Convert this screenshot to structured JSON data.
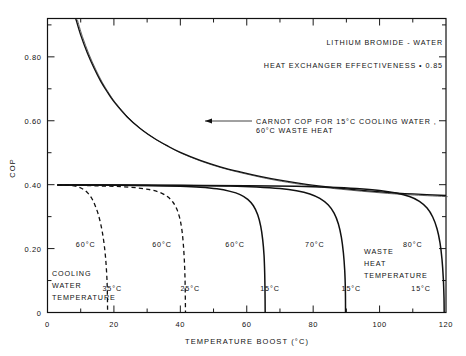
{
  "chart_data": {
    "type": "line",
    "title": "",
    "xlabel": "TEMPERATURE  BOOST  (°C)",
    "ylabel": "COP",
    "xlim": [
      0,
      120
    ],
    "ylim": [
      0,
      0.92
    ],
    "grid": false,
    "legend": "none",
    "x_major_ticks": [
      0,
      20,
      40,
      60,
      80,
      100,
      120
    ],
    "x_major_labels": [
      "0",
      "20",
      "40",
      "60",
      "80",
      "100",
      "120"
    ],
    "x_minor_ticks": [
      10,
      30,
      50,
      70,
      90,
      110
    ],
    "y_major_ticks": [
      0,
      0.2,
      0.4,
      0.6,
      0.8
    ],
    "y_major_labels": [
      "0",
      "0.20",
      "0.40",
      "0.60",
      "0.80"
    ],
    "y_minor_ticks": [
      0.1,
      0.3,
      0.5,
      0.7,
      0.9
    ],
    "annotations": {
      "header_1": "LITHIUM  BROMIDE - WATER",
      "header_2": "HEAT   EXCHANGER   EFFECTIVENESS  • 0.85",
      "carnot_line_1": "CARNOT  COP  FOR  15°C  COOLING  WATER ,",
      "carnot_line_2": "60°C WASTE HEAT",
      "cooling_water_l1": "COOLING",
      "cooling_water_l2": "WATER",
      "cooling_water_l3": "TEMPERATURE",
      "waste_heat_l1": "WASTE",
      "waste_heat_l2": "HEAT",
      "waste_heat_l3": "TEMPERATURE"
    },
    "series": [
      {
        "name": "carnot-cop",
        "style": "double-line",
        "waste_heat": "60°C",
        "cooling_water": "15°C",
        "points": [
          [
            8.5,
            0.92
          ],
          [
            10,
            0.868
          ],
          [
            12,
            0.812
          ],
          [
            14,
            0.765
          ],
          [
            16,
            0.724
          ],
          [
            18,
            0.69
          ],
          [
            20,
            0.66
          ],
          [
            24,
            0.612
          ],
          [
            28,
            0.575
          ],
          [
            32,
            0.546
          ],
          [
            36,
            0.522
          ],
          [
            40,
            0.501
          ],
          [
            46,
            0.476
          ],
          [
            52,
            0.456
          ],
          [
            58,
            0.44
          ],
          [
            64,
            0.426
          ],
          [
            70,
            0.414
          ],
          [
            78,
            0.401
          ],
          [
            86,
            0.391
          ],
          [
            94,
            0.383
          ],
          [
            102,
            0.376
          ],
          [
            110,
            0.371
          ],
          [
            120,
            0.366
          ]
        ]
      },
      {
        "name": "curve-60-35",
        "style": "dashed",
        "waste_heat": "60°C",
        "cooling_water": "35°C",
        "label_top": "60°C",
        "label_bottom": "35°C",
        "points": [
          [
            3.0,
            0.399
          ],
          [
            6,
            0.398
          ],
          [
            8,
            0.396
          ],
          [
            9.5,
            0.392
          ],
          [
            11,
            0.384
          ],
          [
            12.3,
            0.372
          ],
          [
            13.4,
            0.356
          ],
          [
            14.3,
            0.336
          ],
          [
            15.2,
            0.31
          ],
          [
            16.0,
            0.278
          ],
          [
            16.6,
            0.246
          ],
          [
            17.1,
            0.21
          ],
          [
            17.5,
            0.17
          ],
          [
            17.8,
            0.125
          ],
          [
            18.0,
            0.075
          ],
          [
            18.1,
            0.0
          ]
        ]
      },
      {
        "name": "curve-60-25",
        "style": "dashed",
        "waste_heat": "60°C",
        "cooling_water": "25°C",
        "label_top": "60°C",
        "label_bottom": "25°C",
        "points": [
          [
            3.0,
            0.399
          ],
          [
            10,
            0.398
          ],
          [
            16,
            0.396
          ],
          [
            22,
            0.394
          ],
          [
            27,
            0.39
          ],
          [
            31,
            0.384
          ],
          [
            34,
            0.375
          ],
          [
            36.2,
            0.362
          ],
          [
            37.8,
            0.345
          ],
          [
            39.0,
            0.322
          ],
          [
            39.9,
            0.292
          ],
          [
            40.5,
            0.256
          ],
          [
            40.9,
            0.214
          ],
          [
            41.2,
            0.165
          ],
          [
            41.4,
            0.11
          ],
          [
            41.5,
            0.05
          ],
          [
            41.55,
            0.0
          ]
        ]
      },
      {
        "name": "curve-60-15",
        "style": "solid",
        "waste_heat": "60°C",
        "cooling_water": "15°C",
        "label_top": "60°C",
        "label_bottom": "15°C",
        "points": [
          [
            3.0,
            0.399
          ],
          [
            12,
            0.399
          ],
          [
            22,
            0.398
          ],
          [
            32,
            0.397
          ],
          [
            40,
            0.395
          ],
          [
            46,
            0.392
          ],
          [
            51,
            0.387
          ],
          [
            55,
            0.379
          ],
          [
            58,
            0.369
          ],
          [
            60.3,
            0.354
          ],
          [
            62.0,
            0.334
          ],
          [
            63.3,
            0.306
          ],
          [
            64.2,
            0.27
          ],
          [
            64.8,
            0.228
          ],
          [
            65.2,
            0.18
          ],
          [
            65.4,
            0.125
          ],
          [
            65.5,
            0.065
          ],
          [
            65.55,
            0.0
          ]
        ]
      },
      {
        "name": "curve-70-15",
        "style": "solid",
        "waste_heat": "70°C",
        "cooling_water": "15°C",
        "label_top": "70°C",
        "label_bottom": "15°C",
        "points": [
          [
            3.0,
            0.399
          ],
          [
            15,
            0.399
          ],
          [
            30,
            0.398
          ],
          [
            45,
            0.397
          ],
          [
            55,
            0.396
          ],
          [
            63,
            0.393
          ],
          [
            70,
            0.388
          ],
          [
            75,
            0.381
          ],
          [
            79,
            0.371
          ],
          [
            82,
            0.357
          ],
          [
            84.5,
            0.337
          ],
          [
            86.3,
            0.311
          ],
          [
            87.6,
            0.277
          ],
          [
            88.5,
            0.235
          ],
          [
            89.1,
            0.187
          ],
          [
            89.5,
            0.132
          ],
          [
            89.7,
            0.07
          ],
          [
            89.75,
            0.0
          ]
        ]
      },
      {
        "name": "curve-80-15",
        "style": "solid",
        "waste_heat": "80°C",
        "cooling_water": "15°C",
        "label_top": "80°C",
        "label_bottom": "15°C",
        "points": [
          [
            3.0,
            0.399
          ],
          [
            20,
            0.399
          ],
          [
            40,
            0.398
          ],
          [
            60,
            0.397
          ],
          [
            75,
            0.395
          ],
          [
            85,
            0.392
          ],
          [
            93,
            0.388
          ],
          [
            100,
            0.382
          ],
          [
            105,
            0.374
          ],
          [
            109,
            0.363
          ],
          [
            112,
            0.348
          ],
          [
            114.3,
            0.327
          ],
          [
            116.0,
            0.299
          ],
          [
            117.3,
            0.262
          ],
          [
            118.2,
            0.218
          ],
          [
            118.8,
            0.166
          ],
          [
            119.2,
            0.105
          ],
          [
            119.4,
            0.045
          ],
          [
            119.45,
            0.0
          ]
        ]
      }
    ],
    "curve_labels": [
      {
        "id": "lbl-60-35-top",
        "text": "60°C",
        "x": 11.5,
        "y": 0.205
      },
      {
        "id": "lbl-60-35-bot",
        "text": "35°C",
        "x": 19.5,
        "y": 0.068
      },
      {
        "id": "lbl-60-25-top",
        "text": "60°C",
        "x": 34.5,
        "y": 0.205
      },
      {
        "id": "lbl-60-25-bot",
        "text": "25°C",
        "x": 43.0,
        "y": 0.068
      },
      {
        "id": "lbl-60-15-top",
        "text": "60°C",
        "x": 56.5,
        "y": 0.205
      },
      {
        "id": "lbl-60-15-bot",
        "text": "15°C",
        "x": 67.0,
        "y": 0.068
      },
      {
        "id": "lbl-70-15-top",
        "text": "70°C",
        "x": 80.5,
        "y": 0.205
      },
      {
        "id": "lbl-70-15-bot",
        "text": "15°C",
        "x": 91.5,
        "y": 0.068
      },
      {
        "id": "lbl-80-15-top",
        "text": "80°C",
        "x": 110.0,
        "y": 0.205
      },
      {
        "id": "lbl-80-15-bot",
        "text": "15°C",
        "x": 112.5,
        "y": 0.068
      }
    ],
    "colors": {
      "ink": "#111111",
      "background": "#ffffff",
      "carnot_shadow": "#555555"
    }
  }
}
